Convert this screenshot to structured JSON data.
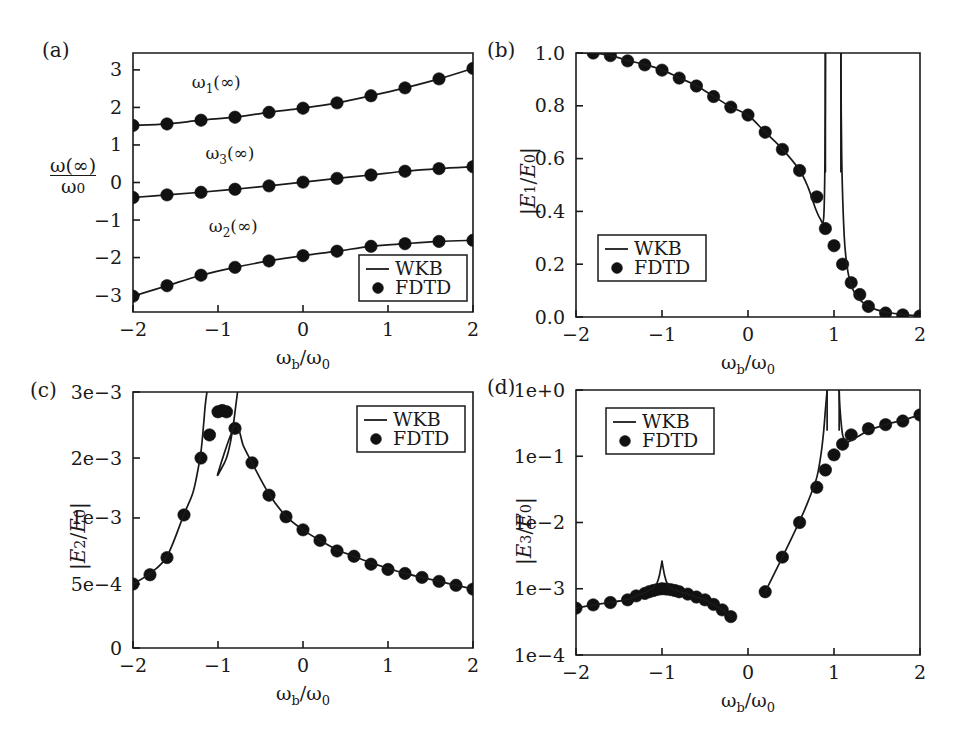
{
  "figure": {
    "width": 964,
    "height": 745,
    "background": "#ffffff",
    "ink_color": "#1a1a1a",
    "marker_color": "#111111"
  },
  "shared": {
    "xlabel": "ω_b/ω_0",
    "xlabel_parts": {
      "num_sym": "ω",
      "num_sub": "b",
      "den_sym": "ω",
      "den_sub": "0"
    },
    "xlim": [
      -2,
      2
    ],
    "xticks": [
      -2,
      -1,
      0,
      1,
      2
    ],
    "xticklabels": [
      "−2",
      "−1",
      "0",
      "1",
      "2"
    ],
    "legend": {
      "entries": [
        {
          "label": "WKB",
          "marker": "line"
        },
        {
          "label": "FDTD",
          "marker": "dot"
        }
      ]
    }
  },
  "panels": [
    {
      "id": "a",
      "letter": "(a)",
      "ylabel": "ω(∞)/ω_0",
      "ylabel_parts": {
        "numerator": "ω(∞)",
        "denominator": "ω",
        "den_sub": "0"
      },
      "ylim": [
        -3.45,
        3.45
      ],
      "yticks": [
        3,
        2,
        1,
        0,
        -1,
        -2,
        -3
      ],
      "yticklabels": [
        "3",
        "2",
        "1",
        "0",
        "−1",
        "−2",
        "−3"
      ],
      "yscale": "linear",
      "annotations": [
        {
          "text": "ω_1(∞)",
          "sym": "ω",
          "sub": "1",
          "tail": "(∞)",
          "x": -1.02,
          "y": 2.52
        },
        {
          "text": "ω_3(∞)",
          "sym": "ω",
          "sub": "3",
          "tail": "(∞)",
          "x": -0.86,
          "y": 0.62
        },
        {
          "text": "ω_2(∞)",
          "sym": "ω",
          "sub": "2",
          "tail": "(∞)",
          "x": -0.82,
          "y": -1.32
        }
      ],
      "legend_pos": "bottom-right"
    },
    {
      "id": "b",
      "letter": "(b)",
      "ylabel": "|E_1/E_0|",
      "ylabel_parts": {
        "e_sym": "E",
        "sub1": "1",
        "den_sym": "E",
        "sub2": "0"
      },
      "ylim": [
        0.0,
        1.0
      ],
      "yticks": [
        1.0,
        0.8,
        0.6,
        0.4,
        0.2,
        0.0
      ],
      "yticklabels": [
        "1.0",
        "0.8",
        "0.6",
        "0.4",
        "0.2",
        "0.0"
      ],
      "yscale": "linear",
      "annotations": [],
      "legend_pos": "mid-left"
    },
    {
      "id": "c",
      "letter": "(c)",
      "ylabel": "|E_2/E_0|",
      "ylabel_parts": {
        "e_sym": "E",
        "sub1": "2",
        "den_sym": "E",
        "sub2": "0"
      },
      "ylim": [
        0,
        0.003
      ],
      "yticks": [
        0.003,
        0.002,
        0.001,
        0.0005,
        0
      ],
      "yticklabels": [
        "3e−3",
        "2e−3",
        "1e−3",
        "5e−4",
        "0"
      ],
      "yscale": "custom-root",
      "annotations": [],
      "legend_pos": "top-right"
    },
    {
      "id": "d",
      "letter": "(d)",
      "ylabel": "|E_3/E_0|",
      "ylabel_parts": {
        "e_sym": "E",
        "sub1": "3",
        "den_sym": "E",
        "sub2": "0"
      },
      "ylim": [
        0.0001,
        1.0
      ],
      "yticks": [
        1,
        0.1,
        0.01,
        0.001,
        0.0001
      ],
      "yticklabels": [
        "1e+0",
        "1e−1",
        "1e−2",
        "1e−3",
        "1e−4"
      ],
      "yscale": "log",
      "annotations": [],
      "legend_pos": "top-left"
    }
  ],
  "chart_data": [
    {
      "panel": "a",
      "type": "line",
      "title": "(a)",
      "xlabel": "ω_b/ω_0",
      "ylabel": "ω(∞)/ω_0",
      "xlim": [
        -2,
        2
      ],
      "ylim": [
        -3.45,
        3.45
      ],
      "grid": false,
      "legend": [
        "WKB",
        "FDTD"
      ],
      "legend_position": "bottom-right",
      "x": [
        -2.0,
        -1.6,
        -1.2,
        -0.8,
        -0.4,
        0.0,
        0.4,
        0.8,
        1.2,
        1.6,
        2.0
      ],
      "series": [
        {
          "name": "ω_1(∞)",
          "style": "line+dots",
          "values": [
            1.52,
            1.56,
            1.66,
            1.74,
            1.87,
            1.98,
            2.12,
            2.31,
            2.52,
            2.76,
            3.04
          ]
        },
        {
          "name": "ω_3(∞)",
          "style": "line+dots",
          "values": [
            -0.4,
            -0.33,
            -0.26,
            -0.18,
            -0.09,
            0.01,
            0.11,
            0.2,
            0.3,
            0.37,
            0.42
          ]
        },
        {
          "name": "ω_2(∞)",
          "style": "line+dots",
          "values": [
            -3.03,
            -2.75,
            -2.47,
            -2.26,
            -2.09,
            -1.95,
            -1.83,
            -1.7,
            -1.63,
            -1.57,
            -1.54
          ]
        }
      ]
    },
    {
      "panel": "b",
      "type": "line",
      "title": "(b)",
      "xlabel": "ω_b/ω_0",
      "ylabel": "|E_1/E_0|",
      "xlim": [
        -2,
        2
      ],
      "ylim": [
        0,
        1.0
      ],
      "grid": false,
      "legend": [
        "WKB",
        "FDTD"
      ],
      "legend_position": "mid-left",
      "asymptotes": [
        0.9,
        1.08
      ],
      "series": [
        {
          "name": "FDTD",
          "style": "dots",
          "x": [
            -1.8,
            -1.6,
            -1.4,
            -1.2,
            -1.0,
            -0.8,
            -0.6,
            -0.4,
            -0.2,
            0.0,
            0.2,
            0.4,
            0.6,
            0.8,
            0.9,
            1.0,
            1.1,
            1.2,
            1.3,
            1.4,
            1.6,
            1.8,
            2.0
          ],
          "values": [
            1.0,
            0.99,
            0.97,
            0.955,
            0.935,
            0.905,
            0.875,
            0.835,
            0.795,
            0.765,
            0.7,
            0.635,
            0.555,
            0.455,
            0.335,
            0.27,
            0.2,
            0.13,
            0.085,
            0.04,
            0.015,
            0.008,
            0.004
          ]
        },
        {
          "name": "WKB-left",
          "style": "line",
          "x": [
            -2.0,
            -1.8,
            -1.6,
            -1.4,
            -1.2,
            -1.0,
            -0.8,
            -0.6,
            -0.4,
            -0.2,
            0.0,
            0.2,
            0.4,
            0.6,
            0.7,
            0.78,
            0.84,
            0.88,
            0.895,
            0.9
          ],
          "values": [
            1.0,
            1.0,
            0.99,
            0.972,
            0.956,
            0.936,
            0.906,
            0.876,
            0.836,
            0.796,
            0.764,
            0.7,
            0.636,
            0.556,
            0.49,
            0.415,
            0.372,
            0.375,
            0.6,
            1.0
          ]
        },
        {
          "name": "WKB-right",
          "style": "line",
          "x": [
            1.08,
            1.09,
            1.12,
            1.16,
            1.2,
            1.25,
            1.3,
            1.4,
            1.5,
            1.6,
            1.8,
            2.0
          ],
          "values": [
            1.0,
            0.6,
            0.3,
            0.175,
            0.12,
            0.085,
            0.065,
            0.04,
            0.027,
            0.019,
            0.009,
            0.004
          ]
        }
      ]
    },
    {
      "panel": "c",
      "type": "line",
      "title": "(c)",
      "xlabel": "ω_b/ω_0",
      "ylabel": "|E_2/E_0|",
      "xlim": [
        -2,
        2
      ],
      "ylim": [
        0,
        0.003
      ],
      "grid": false,
      "legend": [
        "WKB",
        "FDTD"
      ],
      "legend_position": "top-right",
      "series": [
        {
          "name": "FDTD",
          "style": "dots",
          "x": [
            -2.0,
            -1.8,
            -1.6,
            -1.4,
            -1.2,
            -1.1,
            -1.0,
            -0.95,
            -0.9,
            -0.8,
            -0.6,
            -0.4,
            -0.2,
            0.0,
            0.2,
            0.4,
            0.6,
            0.8,
            1.0,
            1.2,
            1.4,
            1.6,
            1.8,
            2.0
          ],
          "values": [
            0.0005,
            0.00057,
            0.0007,
            0.00105,
            0.002,
            0.00235,
            0.0027,
            0.00272,
            0.0027,
            0.00245,
            0.00192,
            0.00138,
            0.00102,
            0.00091,
            0.00083,
            0.00075,
            0.00071,
            0.00065,
            0.00061,
            0.00058,
            0.00055,
            0.00052,
            0.00049,
            0.00046
          ]
        },
        {
          "name": "WKB-left",
          "style": "line",
          "x": [
            -2.0,
            -1.8,
            -1.6,
            -1.4,
            -1.3,
            -1.25,
            -1.2,
            -1.17,
            -1.15,
            -1.13
          ],
          "values": [
            0.0005,
            0.00058,
            0.00071,
            0.00106,
            0.0014,
            0.0017,
            0.0021,
            0.0025,
            0.0028,
            0.003
          ]
        },
        {
          "name": "WKB-right",
          "style": "line",
          "x": [
            -0.77,
            -0.79,
            -0.82,
            -0.86,
            -0.9,
            -0.95,
            -1.0,
            -0.8,
            -0.7,
            -0.6,
            -0.4,
            -0.2,
            0.0,
            0.2,
            0.4,
            0.6,
            0.8,
            1.0,
            1.2,
            1.4,
            1.6,
            1.8,
            2.0
          ],
          "values": [
            0.003,
            0.0028,
            0.0025,
            0.0022,
            0.002,
            0.00185,
            0.00175,
            0.00248,
            0.00218,
            0.00192,
            0.0014,
            0.00103,
            0.00091,
            0.00083,
            0.00076,
            0.00071,
            0.00066,
            0.00062,
            0.00058,
            0.00055,
            0.00052,
            0.00049,
            0.00046
          ]
        }
      ]
    },
    {
      "panel": "d",
      "type": "line",
      "title": "(d)",
      "xlabel": "ω_b/ω_0",
      "ylabel": "|E_3/E_0|",
      "xlim": [
        -2,
        2
      ],
      "ylim": [
        0.0001,
        1.0
      ],
      "grid": false,
      "legend": [
        "WKB",
        "FDTD"
      ],
      "legend_position": "top-left",
      "asymptotes": [
        0.92,
        1.06
      ],
      "series": [
        {
          "name": "FDTD",
          "style": "dots",
          "x": [
            -2.0,
            -1.8,
            -1.6,
            -1.4,
            -1.3,
            -1.2,
            -1.15,
            -1.1,
            -1.05,
            -1.0,
            -0.95,
            -0.9,
            -0.85,
            -0.8,
            -0.7,
            -0.6,
            -0.5,
            -0.4,
            -0.3,
            -0.2,
            0.2,
            0.4,
            0.6,
            0.8,
            0.9,
            1.0,
            1.1,
            1.2,
            1.4,
            1.6,
            1.8,
            2.0
          ],
          "values": [
            0.00051,
            0.00057,
            0.00062,
            0.00068,
            0.00078,
            0.00085,
            0.0009,
            0.00094,
            0.00098,
            0.001,
            0.00099,
            0.00097,
            0.00094,
            0.0009,
            0.00083,
            0.00075,
            0.00068,
            0.00058,
            0.00048,
            0.00038,
            0.0009,
            0.003,
            0.01,
            0.034,
            0.062,
            0.105,
            0.152,
            0.21,
            0.26,
            0.3,
            0.34,
            0.42
          ]
        },
        {
          "name": "WKB-left",
          "style": "line",
          "x": [
            -2.0,
            -1.8,
            -1.6,
            -1.4,
            -1.3,
            -1.2,
            -1.15,
            -1.1,
            -1.06,
            -1.03,
            -1.0
          ],
          "values": [
            0.00051,
            0.00057,
            0.00062,
            0.00069,
            0.00078,
            0.00087,
            0.00094,
            0.00104,
            0.0012,
            0.0016,
            0.0026
          ]
        },
        {
          "name": "WKB-left2",
          "style": "line",
          "x": [
            -1.0,
            -0.97,
            -0.94,
            -0.9,
            -0.85,
            -0.8,
            -0.7,
            -0.6,
            -0.5,
            -0.4,
            -0.3,
            -0.2
          ],
          "values": [
            0.0026,
            0.0016,
            0.0012,
            0.00102,
            0.00096,
            0.00091,
            0.00083,
            0.00075,
            0.00068,
            0.00058,
            0.00048,
            0.00038
          ]
        },
        {
          "name": "WKB-rise",
          "style": "line",
          "x": [
            0.2,
            0.4,
            0.6,
            0.7,
            0.8,
            0.85,
            0.88,
            0.9,
            0.92
          ],
          "values": [
            0.0009,
            0.003,
            0.0105,
            0.021,
            0.048,
            0.11,
            0.24,
            0.5,
            1.0
          ]
        },
        {
          "name": "WKB-fall",
          "style": "line",
          "x": [
            1.06,
            1.07,
            1.1,
            1.15,
            1.2,
            1.3,
            1.4,
            1.6,
            1.8,
            2.0
          ],
          "values": [
            1.0,
            0.52,
            0.21,
            0.165,
            0.175,
            0.205,
            0.245,
            0.3,
            0.35,
            0.42
          ]
        }
      ]
    }
  ]
}
